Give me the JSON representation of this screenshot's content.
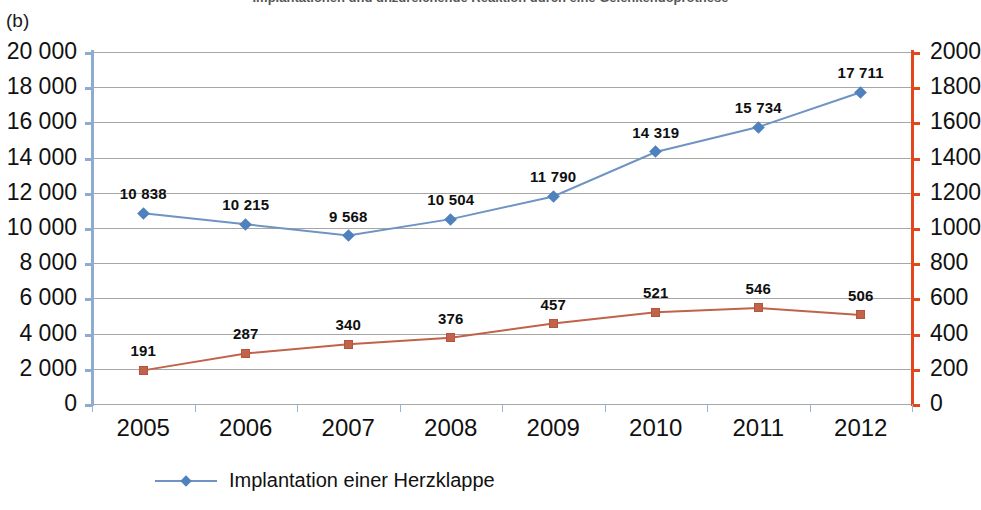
{
  "figure": {
    "clipped_title": "Implantationen und unzureichende Reaktion durch eine Gelenkendoprothese",
    "panel_label": "(b)"
  },
  "chart_data": {
    "type": "line",
    "title": "",
    "xlabel": "",
    "categories": [
      "2005",
      "2006",
      "2007",
      "2008",
      "2009",
      "2010",
      "2011",
      "2012"
    ],
    "grid": true,
    "legend_position": "bottom-left",
    "axes": {
      "left": {
        "label": "",
        "ylim": [
          0,
          20000
        ],
        "step": 2000,
        "color": "#8eabd0",
        "ticks": [
          "0",
          "2 000",
          "4 000",
          "6 000",
          "8 000",
          "10 000",
          "12 000",
          "14 000",
          "16 000",
          "18 000",
          "20 000"
        ]
      },
      "right": {
        "label": "",
        "ylim": [
          0,
          2000
        ],
        "step": 200,
        "color": "#e2471b",
        "ticks": [
          "0",
          "200",
          "400",
          "600",
          "800",
          "1000",
          "1200",
          "1400",
          "1600",
          "1800",
          "2000"
        ]
      }
    },
    "series": [
      {
        "name": "Implantation einer Herzklappe",
        "axis": "left",
        "color": "#4f81bd",
        "marker": "diamond",
        "values": [
          10838,
          10215,
          9568,
          10504,
          11790,
          14319,
          15734,
          17711
        ],
        "labels": [
          "10 838",
          "10 215",
          "9 568",
          "10 504",
          "11 790",
          "14 319",
          "15 734",
          "17 711"
        ]
      },
      {
        "name": "",
        "axis": "right",
        "color": "#c0634a",
        "marker": "square",
        "values": [
          191,
          287,
          340,
          376,
          457,
          521,
          546,
          506
        ],
        "labels": [
          "191",
          "287",
          "340",
          "376",
          "457",
          "521",
          "546",
          "506"
        ]
      }
    ]
  },
  "legend": {
    "entries": [
      {
        "label": "Implantation einer Herzklappe",
        "color": "#4f81bd",
        "marker": "diamond"
      }
    ]
  }
}
